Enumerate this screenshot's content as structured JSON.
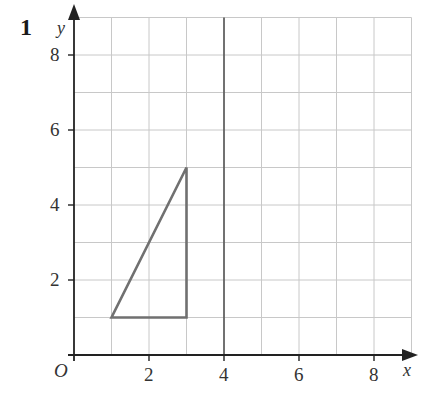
{
  "question_number": "1",
  "axes": {
    "x_label": "x",
    "y_label": "y",
    "origin_label": "O",
    "x_ticks": [
      "2",
      "4",
      "6",
      "8"
    ],
    "y_ticks": [
      "2",
      "4",
      "6",
      "8"
    ],
    "range": {
      "x": [
        0,
        9
      ],
      "y": [
        0,
        9
      ]
    }
  },
  "shapes": {
    "triangle": {
      "vertices": [
        [
          1,
          1
        ],
        [
          3,
          1
        ],
        [
          3,
          5
        ]
      ],
      "color": "#707070"
    },
    "mirror_line": {
      "equation": "x = 4",
      "color": "#555555"
    }
  },
  "colors": {
    "grid": "#c8c8c8",
    "axis": "#222222"
  }
}
